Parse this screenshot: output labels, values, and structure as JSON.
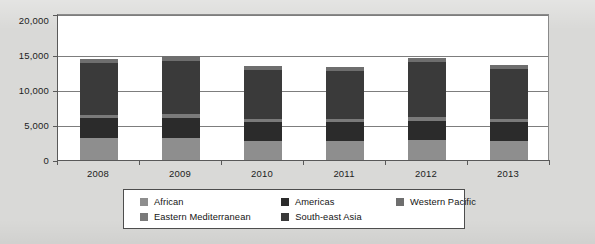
{
  "chart_data": {
    "type": "bar",
    "subtype": "stacked-column",
    "title": "",
    "xlabel": "",
    "ylabel": "",
    "categories": [
      "2008",
      "2009",
      "2010",
      "2011",
      "2012",
      "2013"
    ],
    "ylim": [
      0,
      20000
    ],
    "ytick_values": [
      0,
      5000,
      10000,
      15000,
      20000
    ],
    "ytick_labels": [
      "0",
      "5,000",
      "10,000",
      "15,000",
      "20,000"
    ],
    "grid": true,
    "legend_position": "bottom",
    "series": [
      {
        "name": "African",
        "color": "#8e8e8e",
        "values": [
          3100,
          3100,
          2700,
          2700,
          2800,
          2700
        ]
      },
      {
        "name": "Americas",
        "color": "#2b2b2b",
        "values": [
          2700,
          2800,
          2600,
          2600,
          2700,
          2600
        ]
      },
      {
        "name": "Eastern Mediterranean",
        "color": "#7a7a7a",
        "values": [
          450,
          450,
          400,
          400,
          450,
          400
        ]
      },
      {
        "name": "South-east Asia",
        "color": "#3a3a3a",
        "values": [
          7100,
          7300,
          6700,
          6600,
          7500,
          6800
        ]
      },
      {
        "name": "Western Pacific",
        "color": "#6e6e6e",
        "values": [
          600,
          600,
          550,
          550,
          600,
          550
        ]
      }
    ],
    "totals": [
      13950,
      14250,
      12950,
      12850,
      14050,
      13050
    ]
  },
  "legend": {
    "entries": [
      {
        "label": "African",
        "color": "#8e8e8e"
      },
      {
        "label": "Americas",
        "color": "#2b2b2b"
      },
      {
        "label": "Western Pacific",
        "color": "#6e6e6e"
      },
      {
        "label": "Eastern Mediterranean",
        "color": "#7a7a7a"
      },
      {
        "label": "South-east Asia",
        "color": "#3a3a3a"
      }
    ]
  },
  "axes": {
    "y_labels": [
      "20,000",
      "15,000",
      "10,000",
      "5,000",
      "0"
    ],
    "x_labels": [
      "2008",
      "2009",
      "2010",
      "2011",
      "2012",
      "2013"
    ]
  }
}
